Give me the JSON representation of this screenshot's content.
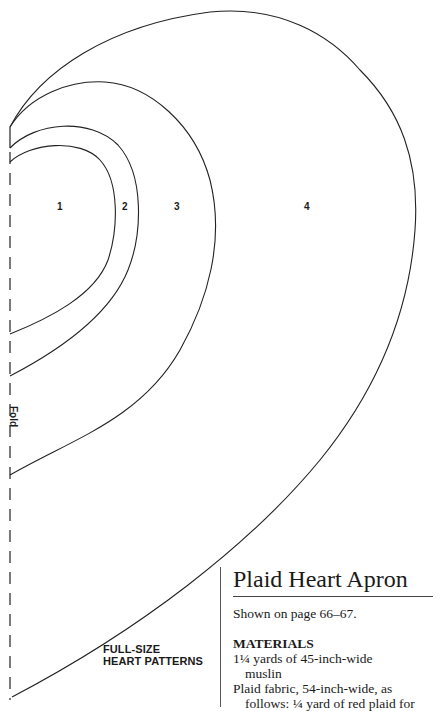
{
  "pattern": {
    "pieces": [
      {
        "label": "1"
      },
      {
        "label": "2"
      },
      {
        "label": "3"
      },
      {
        "label": "4"
      }
    ],
    "fold_label": "Fold",
    "caption_line1": "FULL-SIZE",
    "caption_line2": "HEART PATTERNS"
  },
  "article": {
    "title": "Plaid Heart Apron",
    "shown_on": "Shown on page 66–67.",
    "materials_heading": "MATERIALS",
    "materials": [
      {
        "line": "1¼ yards of 45-inch-wide",
        "cont": "muslin"
      },
      {
        "line": "Plaid fabric, 54-inch-wide, as",
        "cont": "follows: ¼ yard of red plaid for"
      }
    ]
  }
}
